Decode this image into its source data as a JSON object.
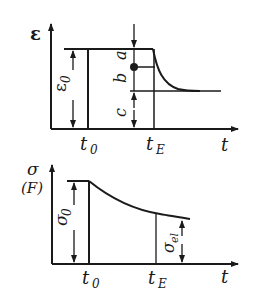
{
  "figure": {
    "top_chart": {
      "y_axis_label": "ε",
      "x_axis_label": "t",
      "t0_label": "t",
      "t0_sub": "0",
      "tE_label": "t",
      "tE_sub": "E",
      "epsilon0_label": "ε",
      "epsilon0_sub": "0",
      "segment_labels": [
        "a",
        "b",
        "c"
      ]
    },
    "bottom_chart": {
      "y_axis_label": "σ",
      "y_axis_label_alt": "(F)",
      "x_axis_label": "t",
      "t0_label": "t",
      "t0_sub": "0",
      "tE_label": "t",
      "tE_sub": "E",
      "sigma0_label": "σ",
      "sigma0_sub": "0",
      "sigma_el_label": "σ",
      "sigma_el_sub": "el"
    },
    "colors": {
      "ink": "#1a1a1a",
      "background": "#ffffff"
    }
  }
}
